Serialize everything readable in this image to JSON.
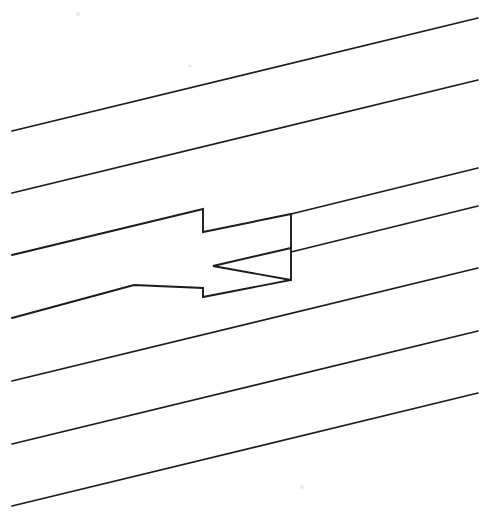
{
  "figure": {
    "type": "line-drawing",
    "background_color": "#fdfdfd",
    "stroke_color": "#1b1b1b",
    "canvas": {
      "width": 489,
      "height": 515
    },
    "caption": ""
  },
  "chart_data": {
    "type": "line",
    "xlabel": "",
    "ylabel": "",
    "xlim": [
      0,
      489
    ],
    "ylim": [
      515,
      0
    ],
    "grid": false,
    "legend": "none",
    "series": [
      {
        "name": "background-line-1",
        "x": [
          12,
          478
        ],
        "y": [
          131,
          18
        ]
      },
      {
        "name": "background-line-2",
        "x": [
          12,
          478
        ],
        "y": [
          193,
          80
        ]
      },
      {
        "name": "background-line-3-left-segment",
        "x": [
          12,
          203
        ],
        "y": [
          255,
          209
        ]
      },
      {
        "name": "background-line-3-right-segment",
        "x": [
          291,
          478
        ],
        "y": [
          190,
          144
        ]
      },
      {
        "name": "background-line-4-left-segment",
        "x": [
          12,
          134
        ],
        "y": [
          318,
          288
        ]
      },
      {
        "name": "background-line-4-right-segment",
        "x": [
          291,
          478
        ],
        "y": [
          252,
          206
        ]
      },
      {
        "name": "background-line-5",
        "x": [
          12,
          478
        ],
        "y": [
          381,
          268
        ]
      },
      {
        "name": "background-line-6",
        "x": [
          12,
          478
        ],
        "y": [
          444,
          331
        ]
      },
      {
        "name": "background-line-7",
        "x": [
          12,
          478
        ],
        "y": [
          506,
          393
        ]
      }
    ],
    "annotations": [
      {
        "name": "notch-peak",
        "x": 134,
        "y": 285
      },
      {
        "name": "rectangle-top-left",
        "x": 203,
        "y": 232
      },
      {
        "name": "rectangle-top-right",
        "x": 291,
        "y": 214
      },
      {
        "name": "rectangle-bottom-right",
        "x": 291,
        "y": 280
      },
      {
        "name": "rectangle-bottom-left",
        "x": 203,
        "y": 297
      },
      {
        "name": "arrow-apex",
        "x": 213,
        "y": 266
      }
    ]
  },
  "shapes": {
    "box_outline_points": "12,255 203,209 203,232 291,214 291,280 203,297 203,288 134,285 12,318",
    "box_outline_name": "angular-box-outline",
    "arrow_head_points": "291,280 213,266 291,248",
    "arrow_head_name": "arrow-head-triangle",
    "box_top_edge": "203,232 291,214",
    "box_right_edge": "291,214 291,280",
    "box_bottom_edge": "203,297 291,280",
    "box_left_edge": "203,232 203,297",
    "notch_left_leg": "12,318 134,285",
    "notch_right_leg": "134,285 203,297",
    "top_left_leg": "12,255 203,232",
    "line3_right": "291,214 478,168",
    "line4_right": "291,252 478,206"
  },
  "background_lines": [
    {
      "name": "line-1",
      "x1": 12,
      "y1": 131,
      "x2": 478,
      "y2": 18
    },
    {
      "name": "line-2",
      "x1": 12,
      "y1": 193,
      "x2": 478,
      "y2": 80
    },
    {
      "name": "line-5",
      "x1": 12,
      "y1": 381,
      "x2": 478,
      "y2": 268
    },
    {
      "name": "line-6",
      "x1": 12,
      "y1": 444,
      "x2": 478,
      "y2": 331
    },
    {
      "name": "line-7",
      "x1": 12,
      "y1": 506,
      "x2": 478,
      "y2": 393
    }
  ]
}
